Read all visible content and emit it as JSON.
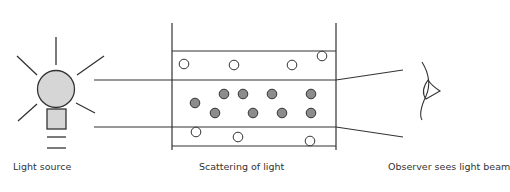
{
  "diagram": {
    "labels": {
      "source": "Light source",
      "scattering": "Scattering of light",
      "observer": "Observer sees light beam"
    },
    "colors": {
      "line": "#333333",
      "bulb_fill": "#d6d6d6",
      "particle_fill": "#8c8c8c",
      "open_particle_fill": "#ffffff"
    },
    "particles": {
      "open": [
        [
          184,
          64
        ],
        [
          234,
          64
        ],
        [
          292,
          64
        ],
        [
          322,
          55
        ],
        [
          196,
          111
        ],
        [
          238,
          117
        ],
        [
          310,
          121
        ]
      ],
      "filled": [
        [
          195,
          103
        ],
        [
          223,
          93
        ],
        [
          243,
          93
        ],
        [
          271,
          93
        ],
        [
          311,
          93
        ],
        [
          214,
          112
        ],
        [
          253,
          112
        ],
        [
          283,
          112
        ],
        [
          311,
          112
        ]
      ]
    }
  }
}
